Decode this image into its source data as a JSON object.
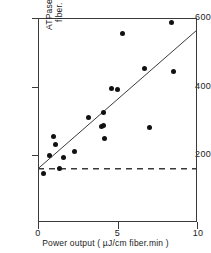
{
  "chart_data": {
    "type": "scatter",
    "title": "",
    "xlabel": "Power output ( µJ/cm fiber.min )",
    "ylabel": "ATPase (pmoles/cm fiber. min)",
    "ylabel_line1": "ATPase (pmoles/cm",
    "ylabel_line2": "fiber. min)",
    "xlim": [
      0,
      10
    ],
    "ylim": [
      0,
      600
    ],
    "xticks": [
      0,
      5,
      10
    ],
    "xtick_labels": [
      "0",
      "5",
      "10"
    ],
    "yticks": [
      200,
      400,
      600
    ],
    "ytick_labels": [
      "200",
      "400",
      "600"
    ],
    "grid": false,
    "legend": false,
    "x": [
      0.35,
      0.7,
      1.0,
      1.1,
      1.35,
      1.6,
      2.3,
      3.2,
      4.0,
      4.1,
      4.15,
      4.2,
      4.6,
      5.0,
      5.3,
      6.7,
      7.0,
      8.4,
      8.5
    ],
    "y": [
      145,
      200,
      255,
      232,
      160,
      193,
      210,
      310,
      283,
      287,
      325,
      248,
      393,
      390,
      555,
      453,
      280,
      587,
      443
    ],
    "series": [
      {
        "name": "ATPase vs power output",
        "points": [
          {
            "x": 0.35,
            "y": 145
          },
          {
            "x": 0.7,
            "y": 200
          },
          {
            "x": 1.0,
            "y": 255
          },
          {
            "x": 1.1,
            "y": 232
          },
          {
            "x": 1.35,
            "y": 160
          },
          {
            "x": 1.6,
            "y": 193
          },
          {
            "x": 2.3,
            "y": 210
          },
          {
            "x": 3.2,
            "y": 310
          },
          {
            "x": 4.0,
            "y": 283
          },
          {
            "x": 4.1,
            "y": 287
          },
          {
            "x": 4.15,
            "y": 325
          },
          {
            "x": 4.2,
            "y": 248
          },
          {
            "x": 4.6,
            "y": 393
          },
          {
            "x": 5.0,
            "y": 390
          },
          {
            "x": 5.3,
            "y": 555
          },
          {
            "x": 6.7,
            "y": 453
          },
          {
            "x": 7.0,
            "y": 280
          },
          {
            "x": 8.4,
            "y": 587
          },
          {
            "x": 8.5,
            "y": 443
          }
        ],
        "marker": "filled-circle",
        "color": "#111111"
      }
    ],
    "regression_line": {
      "name": "fitted-regression-line",
      "x0": 0.0,
      "y0": 160,
      "x1": 10.0,
      "y1": 565,
      "style": "solid",
      "color": "#3a3a3a"
    },
    "reference_line": {
      "name": "baseline-atpase",
      "y": 160,
      "style": "dashed",
      "color": "#3a3a3a"
    },
    "axis_color": "#3a3a3a",
    "marker_color": "#111111",
    "background": "#ffffff"
  }
}
